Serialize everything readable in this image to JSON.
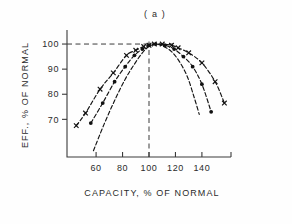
{
  "chart_data": {
    "type": "line",
    "title": "( a )",
    "xlabel": "CAPACITY, % OF NORMAL",
    "ylabel": "EFF., % OF NORMAL",
    "xlim": [
      38,
      162
    ],
    "ylim": [
      55,
      104
    ],
    "xticks": [
      60,
      80,
      100,
      120,
      140
    ],
    "xtick_labels": [
      "60",
      "80",
      "100",
      "120",
      "140"
    ],
    "yticks": [
      70,
      80,
      90,
      100
    ],
    "ytick_labels": [
      "70",
      "80",
      "90",
      "100"
    ],
    "grid": false,
    "legend": null,
    "reference_lines": [
      {
        "name": "normal-efficiency-line",
        "orientation": "horizontal",
        "value": 100
      },
      {
        "name": "normal-capacity-line",
        "orientation": "vertical",
        "value": 100
      }
    ],
    "series": [
      {
        "name": "wide-range-curve",
        "marker": "x",
        "linestyle": "dashed",
        "x": [
          45,
          52,
          63,
          73,
          83,
          90,
          96,
          100,
          104,
          110,
          117,
          122,
          130,
          140,
          150,
          157
        ],
        "y": [
          67.5,
          72.5,
          82,
          88.5,
          95.5,
          97.5,
          99,
          99.5,
          100,
          100,
          99.5,
          98.5,
          96.5,
          92.5,
          85,
          76.5
        ]
      },
      {
        "name": "mid-range-curve",
        "marker": "circle",
        "linestyle": "dashed",
        "x": [
          56,
          65,
          74,
          82,
          89,
          95,
          100,
          105,
          112,
          119,
          126,
          133,
          140,
          147
        ],
        "y": [
          68.5,
          76.5,
          85,
          91,
          95.5,
          98,
          99.5,
          100,
          99.5,
          98,
          95,
          91,
          84,
          73
        ]
      },
      {
        "name": "narrow-range-curve",
        "marker": "none",
        "linestyle": "dashed",
        "x": [
          58,
          66,
          74,
          82,
          89,
          95,
          100,
          105,
          111,
          117,
          123,
          129,
          134,
          138
        ],
        "y": [
          57.5,
          68,
          77.5,
          86,
          92,
          96.5,
          99,
          100,
          99,
          97,
          93,
          87,
          79,
          72
        ]
      }
    ]
  }
}
